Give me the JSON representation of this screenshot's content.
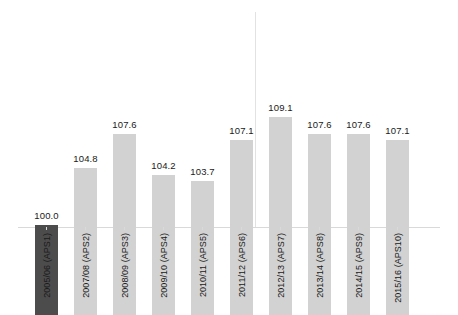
{
  "chart_data": {
    "type": "bar",
    "title": "",
    "subtitle": "",
    "xlabel": "",
    "ylabel": "",
    "grid": false,
    "legend": null,
    "ylim": [
      92.4,
      110.5
    ],
    "baseline_value": 92.4,
    "categories": [
      "2005/06 (APS1)",
      "2007/08 (APS2)",
      "2008/09 (APS3)",
      "2009/10 (APS4)",
      "2010/11 (APS5)",
      "2011/12 (APS6)",
      "2012/13 (APS7)",
      "2013/14 (APS8)",
      "2014/15 (APS9)",
      "2015/16 (APS10)"
    ],
    "values": [
      100.0,
      104.8,
      107.6,
      104.2,
      103.7,
      107.1,
      109.1,
      107.6,
      107.6,
      107.1
    ],
    "value_labels": [
      "100.0",
      "104.8",
      "107.6",
      "104.2",
      "103.7",
      "107.1",
      "109.1",
      "107.6",
      "107.6",
      "107.1"
    ],
    "highlight_index": 0,
    "divider_after_index": 5,
    "colors": {
      "bar": "#d2d2d2",
      "bar_highlight": "#4c4c4c",
      "axis": "#d9d9d9",
      "divider": "#e2e2e2",
      "label_text": "#1a1a1a",
      "background": "#ffffff"
    }
  }
}
